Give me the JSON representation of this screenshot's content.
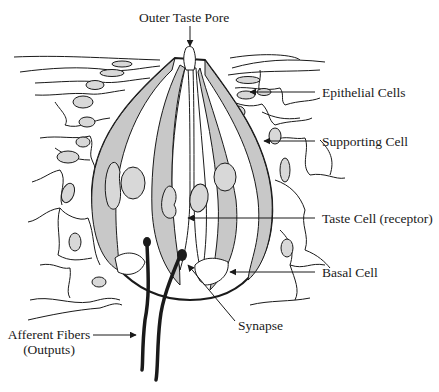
{
  "diagram": {
    "colors": {
      "line": "#1a1a1a",
      "fill_gray": "#c8c8c8",
      "nucleus_gray": "#d8d8d8",
      "background": "#ffffff"
    },
    "labels": {
      "outer_taste_pore": "Outer Taste Pore",
      "epithelial_cells": "Epithelial Cells",
      "supporting_cell": "Supporting Cell",
      "taste_cell": "Taste Cell (receptor)",
      "basal_cell": "Basal Cell",
      "synapse": "Synapse",
      "afferent_fibers_line1": "Afferent Fibers",
      "afferent_fibers_line2": "(Outputs)"
    }
  }
}
